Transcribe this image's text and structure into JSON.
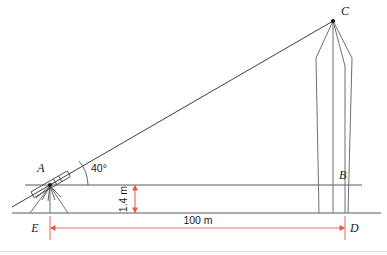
{
  "figure": {
    "background_color": "#ffffff",
    "line_color": "#555a5e",
    "dimension_color": "#e8736b",
    "label_color": "#1a1a1a"
  },
  "points": {
    "A": {
      "label": "A",
      "role": "theodolite-position",
      "x": 50,
      "y": 185
    },
    "B": {
      "label": "B",
      "role": "obelisk-at-instrument-height",
      "x": 345,
      "y": 185
    },
    "C": {
      "label": "C",
      "role": "obelisk-apex",
      "x": 333,
      "y": 20
    },
    "D": {
      "label": "D",
      "role": "obelisk-base-on-ground",
      "x": 345,
      "y": 213
    },
    "E": {
      "label": "E",
      "role": "tripod-foot-on-ground",
      "x": 50,
      "y": 213
    }
  },
  "angle": {
    "label": "40°",
    "value": 40,
    "unit": "degrees",
    "vertex": "A",
    "between": [
      "horizontal AB",
      "line of sight AC"
    ]
  },
  "dimensions": [
    {
      "label": "1.4 m",
      "value": 1.4,
      "unit": "m",
      "orientation": "vertical",
      "measures": "instrument height above ground",
      "from": "ground line",
      "to": "horizontal sight level"
    },
    {
      "label": "100 m",
      "value": 100,
      "unit": "m",
      "orientation": "horizontal",
      "measures": "ground distance",
      "from": "E",
      "to": "D"
    }
  ],
  "objects": [
    {
      "name": "theodolite",
      "at": "A",
      "description": "surveying telescope mounted on a tripod"
    },
    {
      "name": "obelisk",
      "at": "CD",
      "description": "tall tapered monument with pyramidal top"
    },
    {
      "name": "ground-line",
      "description": "horizontal baseline through E and D"
    },
    {
      "name": "horizontal-sight-line",
      "description": "horizontal reference line through A and B"
    },
    {
      "name": "line-of-sight",
      "description": "inclined line from A to C"
    }
  ]
}
